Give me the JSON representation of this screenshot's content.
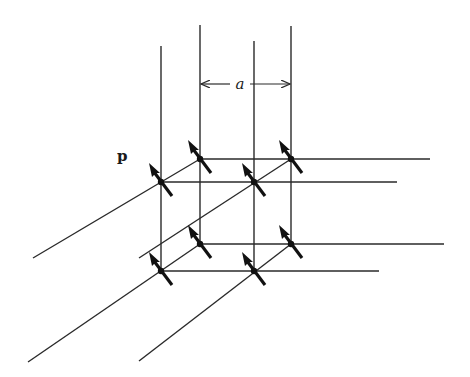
{
  "diagram": {
    "labels": {
      "dipole_moment": "p",
      "lattice_spacing": "a"
    },
    "colors": {
      "line": "#2a2a2a",
      "arrow": "#111111",
      "background": "#ffffff"
    },
    "vertical_lines": [
      {
        "x": 161,
        "y1": 46,
        "y2": 271
      },
      {
        "x": 200,
        "y1": 25,
        "y2": 244
      },
      {
        "x": 254,
        "y1": 41,
        "y2": 271
      },
      {
        "x": 291,
        "y1": 26,
        "y2": 244
      }
    ],
    "horizontal_lines": [
      {
        "x1": 200,
        "x2": 430,
        "y": 159
      },
      {
        "x1": 161,
        "x2": 397,
        "y": 182
      },
      {
        "x1": 200,
        "x2": 444,
        "y": 244
      },
      {
        "x1": 161,
        "x2": 379,
        "y": 271
      }
    ],
    "diagonal_lines": [
      {
        "x1": 33,
        "y1": 258,
        "x2": 200,
        "y2": 159
      },
      {
        "x1": 139,
        "y1": 258,
        "x2": 291,
        "y2": 159
      },
      {
        "x1": 28,
        "y1": 362,
        "x2": 200,
        "y2": 244
      },
      {
        "x1": 139,
        "y1": 361,
        "x2": 291,
        "y2": 244
      }
    ],
    "nodes": [
      {
        "x": 200,
        "y": 159
      },
      {
        "x": 291,
        "y": 159
      },
      {
        "x": 161,
        "y": 182
      },
      {
        "x": 254,
        "y": 182
      },
      {
        "x": 200,
        "y": 244
      },
      {
        "x": 291,
        "y": 244
      },
      {
        "x": 161,
        "y": 271
      },
      {
        "x": 254,
        "y": 271
      }
    ],
    "dimension": {
      "x1": 200,
      "x2": 291,
      "y": 84,
      "label_x": 240
    }
  }
}
